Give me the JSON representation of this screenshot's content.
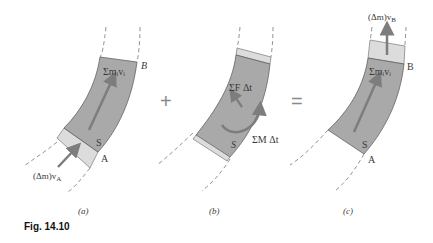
{
  "figure": {
    "caption": "Fig. 14.10",
    "colors": {
      "body_fill": "#a9a9a9",
      "slab_fill": "#dcdcdc",
      "arrow": "#7d7d7d",
      "outline": "#555555",
      "dash": "#777777",
      "background": "#ffffff"
    }
  },
  "operators": {
    "plus": "+",
    "equals": "="
  },
  "panels": [
    {
      "id": "a",
      "sublabel": "(a)",
      "point_top": "B",
      "point_bottom": "A",
      "system_label": "S",
      "body_label": "Σmᵢvᵢ",
      "inflow_label": "(Δm)v",
      "inflow_sub": "A"
    },
    {
      "id": "b",
      "sublabel": "(b)",
      "system_label": "S",
      "force_label": "ΣF Δt",
      "moment_label": "ΣM Δt"
    },
    {
      "id": "c",
      "sublabel": "(c)",
      "point_top": "B",
      "point_bottom": "A",
      "system_label": "S",
      "body_label": "Σmᵢvᵢ",
      "outflow_label": "(Δm)v",
      "outflow_sub": "B"
    }
  ]
}
